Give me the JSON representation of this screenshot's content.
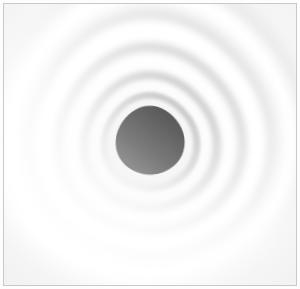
{
  "artwork": {
    "title": "Nested Rounded-Triangle Tunnel",
    "medium": "abstract architectural photograph",
    "orientation": "square",
    "alt_text": "Concentric rounded triangular rings receding into a dark gray center",
    "frame": {
      "border_color": "#c9c9c9",
      "border_width_px": 1,
      "inset_px": 3,
      "background_color": "#ffffff"
    },
    "palette": {
      "background": "#fdfdfd",
      "highlight_white": "#ffffff",
      "soft_shade": "#f2f2f2",
      "mid_shade": "#e2e2e2",
      "deep_shade": "#cfcfcf",
      "core_dark": "#5c5c5c",
      "core_mid": "#767676",
      "core_light": "#8e8e8e"
    },
    "composition": {
      "ring_count": 5,
      "shape": "reuleaux-triangle",
      "apex_direction": "up",
      "rotation_deg": -4,
      "center_x_pct": 50,
      "center_y_pct": 48,
      "vanishing_point": "center"
    },
    "rings": [
      {
        "name": "ring-outer-1",
        "scale": 1.62,
        "offset_y": -0.04,
        "fill": "#fbfbfb",
        "shade": "#e6e6e6",
        "rim": "#ffffff"
      },
      {
        "name": "ring-outer-2",
        "scale": 1.28,
        "offset_y": -0.02,
        "fill": "#fafafa",
        "shade": "#e0e0e0",
        "rim": "#ffffff"
      },
      {
        "name": "ring-mid-3",
        "scale": 0.97,
        "offset_y": 0.0,
        "fill": "#f7f7f7",
        "shade": "#dadada",
        "rim": "#ffffff"
      },
      {
        "name": "ring-mid-4",
        "scale": 0.71,
        "offset_y": 0.01,
        "fill": "#f2f2f2",
        "shade": "#d0d0d0",
        "rim": "#fdfdfd"
      },
      {
        "name": "ring-inner-5",
        "scale": 0.5,
        "offset_y": 0.02,
        "fill": "#ededed",
        "shade": "#c4c4c4",
        "rim": "#fbfbfb"
      }
    ],
    "core": {
      "name": "core-aperture",
      "scale": 0.33,
      "offset_y": 0.01,
      "gradient_from": "#8f8f8f",
      "gradient_to": "#565656",
      "gradient_angle_deg": 215
    }
  }
}
